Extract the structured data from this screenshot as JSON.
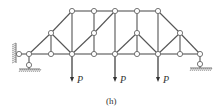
{
  "figure": {
    "caption": "(h)",
    "type": "truss diagram",
    "colors": {
      "member": "#555555",
      "node_fill": "#ffffff",
      "node_stroke": "#666666",
      "load": "#333333",
      "hatch": "#777777"
    },
    "nodes": [
      {
        "id": "A",
        "x": 19,
        "y": 54
      },
      {
        "id": "B1",
        "x": 29,
        "y": 54
      },
      {
        "id": "B2",
        "x": 51,
        "y": 54
      },
      {
        "id": "B3",
        "x": 72,
        "y": 54
      },
      {
        "id": "B4",
        "x": 94,
        "y": 54
      },
      {
        "id": "B5",
        "x": 115,
        "y": 54
      },
      {
        "id": "B6",
        "x": 137,
        "y": 54
      },
      {
        "id": "B7",
        "x": 158,
        "y": 54
      },
      {
        "id": "B8",
        "x": 180,
        "y": 54
      },
      {
        "id": "B9",
        "x": 200,
        "y": 54
      },
      {
        "id": "M1",
        "x": 51,
        "y": 33
      },
      {
        "id": "M2",
        "x": 94,
        "y": 33
      },
      {
        "id": "M3",
        "x": 137,
        "y": 33
      },
      {
        "id": "M4",
        "x": 180,
        "y": 33
      },
      {
        "id": "T1",
        "x": 72,
        "y": 11
      },
      {
        "id": "T2",
        "x": 94,
        "y": 11
      },
      {
        "id": "T3",
        "x": 115,
        "y": 11
      },
      {
        "id": "T4",
        "x": 137,
        "y": 11
      },
      {
        "id": "T5",
        "x": 158,
        "y": 11
      },
      {
        "id": "S1",
        "x": 29,
        "y": 65
      },
      {
        "id": "S2",
        "x": 200,
        "y": 64
      }
    ],
    "members": [
      [
        "A",
        "B1"
      ],
      [
        "B1",
        "B2"
      ],
      [
        "B2",
        "B3"
      ],
      [
        "B3",
        "B4"
      ],
      [
        "B4",
        "B5"
      ],
      [
        "B5",
        "B6"
      ],
      [
        "B6",
        "B7"
      ],
      [
        "B7",
        "B8"
      ],
      [
        "B8",
        "B9"
      ],
      [
        "T1",
        "T2"
      ],
      [
        "T2",
        "T3"
      ],
      [
        "T3",
        "T4"
      ],
      [
        "T4",
        "T5"
      ],
      [
        "B1",
        "M1"
      ],
      [
        "M1",
        "T1"
      ],
      [
        "T5",
        "M4"
      ],
      [
        "M4",
        "B9"
      ],
      [
        "M1",
        "B2"
      ],
      [
        "M1",
        "B3"
      ],
      [
        "T1",
        "B3"
      ],
      [
        "B3",
        "M2"
      ],
      [
        "M2",
        "T3"
      ],
      [
        "T2",
        "M2"
      ],
      [
        "M2",
        "B4"
      ],
      [
        "T3",
        "B5"
      ],
      [
        "B5",
        "M3"
      ],
      [
        "M3",
        "T4"
      ],
      [
        "M3",
        "B6"
      ],
      [
        "M3",
        "B7"
      ],
      [
        "T5",
        "B7"
      ],
      [
        "B7",
        "M4"
      ],
      [
        "M4",
        "B8"
      ],
      [
        "B1",
        "S1"
      ],
      [
        "B9",
        "S2"
      ]
    ],
    "loads": [
      {
        "label": "P",
        "x": 72,
        "y_start": 54,
        "y_end": 82
      },
      {
        "label": "P",
        "x": 115,
        "y_start": 54,
        "y_end": 82
      },
      {
        "label": "P",
        "x": 158,
        "y_start": 54,
        "y_end": 82
      }
    ],
    "supports": {
      "left_wall": {
        "x": 14,
        "y1": 43,
        "y2": 63
      },
      "left_ground": {
        "x1": 19,
        "x2": 40,
        "y": 69
      },
      "right_ground": {
        "x1": 190,
        "x2": 212,
        "y": 68
      }
    }
  }
}
